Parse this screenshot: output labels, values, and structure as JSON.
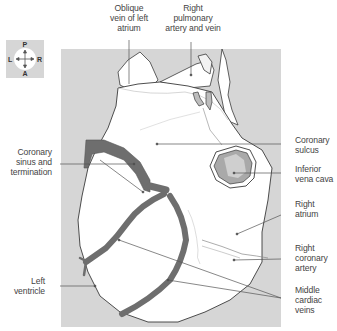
{
  "figure": {
    "type": "anatomical-illustration"
  },
  "compass": {
    "top": "P",
    "bottom": "A",
    "left": "L",
    "right": "R"
  },
  "labels": {
    "oblique_vein": [
      "Oblique",
      "vein of left",
      "atrium"
    ],
    "right_pulmonary": [
      "Right",
      "pulmonary",
      "artery and vein"
    ],
    "coronary_sulcus": [
      "Coronary",
      "sulcus"
    ],
    "inferior_vena_cava": [
      "Inferior",
      "vena cava"
    ],
    "right_atrium": [
      "Right",
      "atrium"
    ],
    "right_coronary_artery": [
      "Right",
      "coronary",
      "artery"
    ],
    "middle_cardiac_veins": [
      "Middle",
      "cardiac",
      "veins"
    ],
    "coronary_sinus": [
      "Coronary",
      "sinus and",
      "termination"
    ],
    "left_ventricle": [
      "Left",
      "ventricle"
    ]
  },
  "colors": {
    "panel": "#d6d6d6",
    "vessel": "#6e6e6e",
    "outline": "#3a3a3a",
    "heart": "#ffffff",
    "ivc_fill": "#a9a9a9"
  }
}
